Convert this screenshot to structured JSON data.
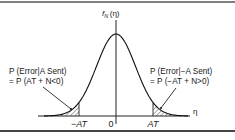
{
  "figure": {
    "type": "gaussian-pdf-error-regions",
    "y_axis_label": "f_N (η)",
    "y_axis_label_main": "f",
    "y_axis_label_sub": "N",
    "y_axis_label_arg": "(η)",
    "x_axis_label": "η",
    "ticks": [
      {
        "label": "−AT",
        "value": -1
      },
      {
        "label": "0",
        "value": 0
      },
      {
        "label": "AT",
        "value": 1
      }
    ],
    "left_annotation": {
      "line1": "P (Error|A Sent)",
      "line2": "= P (AT + N<0)"
    },
    "right_annotation": {
      "line1": "P (Error|−A Sent)",
      "line2": "= P (−AT + N>0)"
    },
    "shaded_regions": [
      "η < −AT",
      "η > AT"
    ],
    "colors": {
      "ink": "#222222",
      "background": "#ffffff",
      "frame": "#3a3a3a"
    }
  }
}
